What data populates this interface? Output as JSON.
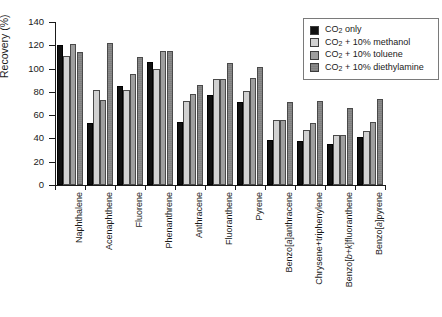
{
  "chart_data": {
    "type": "bar",
    "title": "",
    "xlabel": "",
    "ylabel": "Recovery (%)",
    "ylim": [
      0,
      140
    ],
    "yticks": [
      0,
      20,
      40,
      60,
      80,
      100,
      120,
      140
    ],
    "grid": false,
    "legend_position": "top-right",
    "categories": [
      "Naphthalene",
      "Acenaphthene",
      "Fluorene",
      "Phenanthrene",
      "Anthracene",
      "Fluoranthene",
      "Pyrene",
      "Benzo[a]anthracene",
      "Chrysene+triphenylene",
      "Benzo[b+k]fluoranthene",
      "Benzo[a]pyrene"
    ],
    "series": [
      {
        "name": "CO2 only",
        "color": "#111111",
        "values": [
          120,
          53,
          85,
          106,
          54,
          77,
          71,
          39,
          38,
          35,
          41
        ]
      },
      {
        "name": "CO2 + 10% methanol",
        "color": "#d2d2d2",
        "values": [
          111,
          82,
          82,
          100,
          72,
          91,
          81,
          56,
          47,
          43,
          46
        ]
      },
      {
        "name": "CO2 + 10% toluene",
        "color": "#9e9e9e",
        "values": [
          121,
          73,
          95,
          115,
          78,
          91,
          92,
          56,
          53,
          43,
          54
        ]
      },
      {
        "name": "CO2 + 10% diethylamine",
        "color": "#8a8a8a",
        "values": [
          114,
          122,
          110,
          115,
          86,
          105,
          101,
          71,
          72,
          66,
          74
        ]
      }
    ]
  },
  "legend": {
    "items": [
      {
        "label_pre": "CO",
        "sub": "2",
        "label_post": " only"
      },
      {
        "label_pre": "CO",
        "sub": "2",
        "label_post": " + 10% methanol"
      },
      {
        "label_pre": "CO",
        "sub": "2",
        "label_post": " + 10% toluene"
      },
      {
        "label_pre": "CO",
        "sub": "2",
        "label_post": " + 10% diethylamine"
      }
    ]
  }
}
